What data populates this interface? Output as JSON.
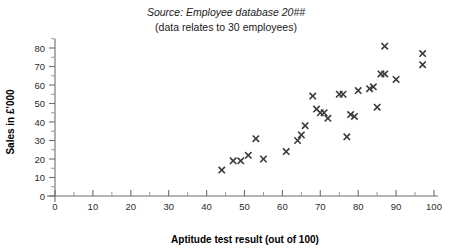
{
  "header": {
    "source_line": "Source: Employee database 20##",
    "note_line": "(data relates to 30 employees)"
  },
  "chart_data": {
    "type": "scatter",
    "title": "",
    "subtitle": "Source: Employee database 20## (data relates to 30 employees)",
    "xlabel": "Aptitude test result (out of 100)",
    "ylabel": "Sales in £'000",
    "xlim": [
      0,
      100
    ],
    "ylim": [
      0,
      85
    ],
    "x_ticks": [
      0,
      10,
      20,
      30,
      40,
      50,
      60,
      70,
      80,
      90,
      100
    ],
    "y_ticks": [
      0,
      10,
      20,
      30,
      40,
      50,
      60,
      70,
      80
    ],
    "x_minor_tick_step": 5,
    "y_minor_tick_step": 5,
    "grid": false,
    "legend": false,
    "marker": "x",
    "marker_color": "#3a3a3a",
    "n_points": 30,
    "points": [
      {
        "x": 44,
        "y": 14
      },
      {
        "x": 47,
        "y": 19
      },
      {
        "x": 49,
        "y": 19
      },
      {
        "x": 51,
        "y": 22
      },
      {
        "x": 53,
        "y": 31
      },
      {
        "x": 55,
        "y": 20
      },
      {
        "x": 61,
        "y": 24
      },
      {
        "x": 64,
        "y": 30
      },
      {
        "x": 65,
        "y": 33
      },
      {
        "x": 66,
        "y": 38
      },
      {
        "x": 68,
        "y": 54
      },
      {
        "x": 69,
        "y": 47
      },
      {
        "x": 70,
        "y": 45
      },
      {
        "x": 71,
        "y": 45
      },
      {
        "x": 72,
        "y": 42
      },
      {
        "x": 75,
        "y": 55
      },
      {
        "x": 76,
        "y": 55
      },
      {
        "x": 77,
        "y": 32
      },
      {
        "x": 78,
        "y": 44
      },
      {
        "x": 79,
        "y": 43
      },
      {
        "x": 80,
        "y": 57
      },
      {
        "x": 83,
        "y": 58
      },
      {
        "x": 84,
        "y": 59
      },
      {
        "x": 85,
        "y": 48
      },
      {
        "x": 86,
        "y": 66
      },
      {
        "x": 87,
        "y": 66
      },
      {
        "x": 87,
        "y": 81
      },
      {
        "x": 90,
        "y": 63
      },
      {
        "x": 97,
        "y": 77
      },
      {
        "x": 97,
        "y": 71
      }
    ]
  }
}
